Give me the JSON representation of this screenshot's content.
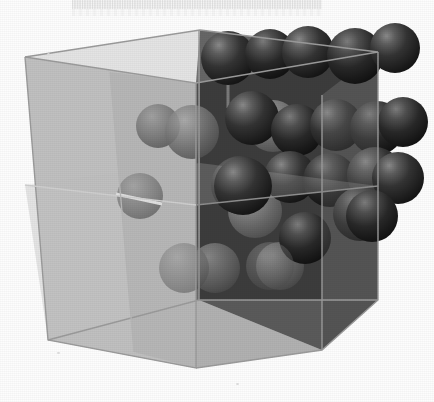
{
  "figure": {
    "caption_band_text": "",
    "background_color": "#fdfdfd",
    "canvas": {
      "width": 434,
      "height": 402
    }
  },
  "cube": {
    "name": "unit-cell-cube",
    "description": "Translucent cube drawn in oblique perspective, viewed from slightly above and to the left",
    "vertices": {
      "front_top_left": [
        25,
        57
      ],
      "front_top_right": [
        196,
        83
      ],
      "front_bottom_left": [
        48,
        340
      ],
      "front_bottom_right": [
        196,
        368
      ],
      "back_top_left": [
        200,
        30
      ],
      "back_top_right": [
        378,
        52
      ],
      "back_bottom_left": [
        199,
        300
      ],
      "back_bottom_right": [
        322,
        350
      ]
    },
    "faces": [
      {
        "name": "left-outer-face",
        "fill": "#bdbdbd",
        "opacity": 0.95
      },
      {
        "name": "front-outer-face",
        "fill": "#a8a8a8",
        "opacity": 0.92
      },
      {
        "name": "bottom-outer-face",
        "fill": "#b4b4b4",
        "opacity": 0.9
      },
      {
        "name": "interior-back-face",
        "fill": "#3c3c3c",
        "opacity": 1.0
      },
      {
        "name": "interior-side-face",
        "fill": "#4a4a4a",
        "opacity": 1.0
      },
      {
        "name": "interior-floor-face",
        "fill": "#565656",
        "opacity": 1.0
      }
    ],
    "edge_color": "#8c8c8c",
    "interior_edge_color": "#9a9a9a"
  },
  "atoms": {
    "legend": {
      "exterior_sphere_color": "#2a2a2a",
      "interior_sphere_color": "#7b7b7b",
      "highlight_color": "#8e8e8e",
      "radius_px": 27
    },
    "exterior_spheres": [
      {
        "id": "a1",
        "cx": 228,
        "cy": 58,
        "r": 27,
        "shade": "dark"
      },
      {
        "id": "a2",
        "cx": 270,
        "cy": 54,
        "r": 25,
        "shade": "dark"
      },
      {
        "id": "a3",
        "cx": 308,
        "cy": 52,
        "r": 26,
        "shade": "dark"
      },
      {
        "id": "a4",
        "cx": 355,
        "cy": 56,
        "r": 28,
        "shade": "dark"
      },
      {
        "id": "a5",
        "cx": 393,
        "cy": 48,
        "r": 25,
        "shade": "dark"
      },
      {
        "id": "a6",
        "cx": 252,
        "cy": 118,
        "r": 27,
        "shade": "dark"
      },
      {
        "id": "a7",
        "cx": 297,
        "cy": 130,
        "r": 26,
        "shade": "dark"
      },
      {
        "id": "a8",
        "cx": 336,
        "cy": 125,
        "r": 26,
        "shade": "dark"
      },
      {
        "id": "a9",
        "cx": 377,
        "cy": 128,
        "r": 27,
        "shade": "dark"
      },
      {
        "id": "a10",
        "cx": 240,
        "cy": 185,
        "r": 29,
        "shade": "dark"
      },
      {
        "id": "a11",
        "cx": 290,
        "cy": 177,
        "r": 26,
        "shade": "dark"
      },
      {
        "id": "a12",
        "cx": 330,
        "cy": 180,
        "r": 27,
        "shade": "dark"
      },
      {
        "id": "a13",
        "cx": 375,
        "cy": 175,
        "r": 28,
        "shade": "dark"
      },
      {
        "id": "a14",
        "cx": 360,
        "cy": 214,
        "r": 27,
        "shade": "dark"
      },
      {
        "id": "a15",
        "cx": 305,
        "cy": 238,
        "r": 26,
        "shade": "dark"
      }
    ],
    "interior_spheres": [
      {
        "id": "i1",
        "cx": 158,
        "cy": 126,
        "r": 22,
        "shade": "light"
      },
      {
        "id": "i2",
        "cx": 192,
        "cy": 132,
        "r": 27,
        "shade": "light"
      },
      {
        "id": "i3",
        "cx": 273,
        "cy": 126,
        "r": 26,
        "shade": "light"
      },
      {
        "id": "i4",
        "cx": 140,
        "cy": 196,
        "r": 23,
        "shade": "light"
      },
      {
        "id": "i5",
        "cx": 255,
        "cy": 211,
        "r": 27,
        "shade": "light"
      },
      {
        "id": "i6",
        "cx": 192,
        "cy": 268,
        "r": 25,
        "shade": "light"
      },
      {
        "id": "i7",
        "cx": 280,
        "cy": 266,
        "r": 24,
        "shade": "light"
      },
      {
        "id": "i8",
        "cx": 160,
        "cy": 236,
        "r": 20,
        "shade": "light"
      }
    ],
    "bond_rods": [
      {
        "id": "r1",
        "x1": 228,
        "y1": 58,
        "x2": 228,
        "y2": 104,
        "color": "#6a6a6a"
      },
      {
        "id": "r2",
        "x1": 120,
        "y1": 196,
        "x2": 160,
        "y2": 204,
        "color": "#d5d5d5"
      },
      {
        "id": "r3",
        "x1": 240,
        "y1": 185,
        "x2": 300,
        "y2": 205,
        "color": "#4a4a4a"
      }
    ]
  }
}
